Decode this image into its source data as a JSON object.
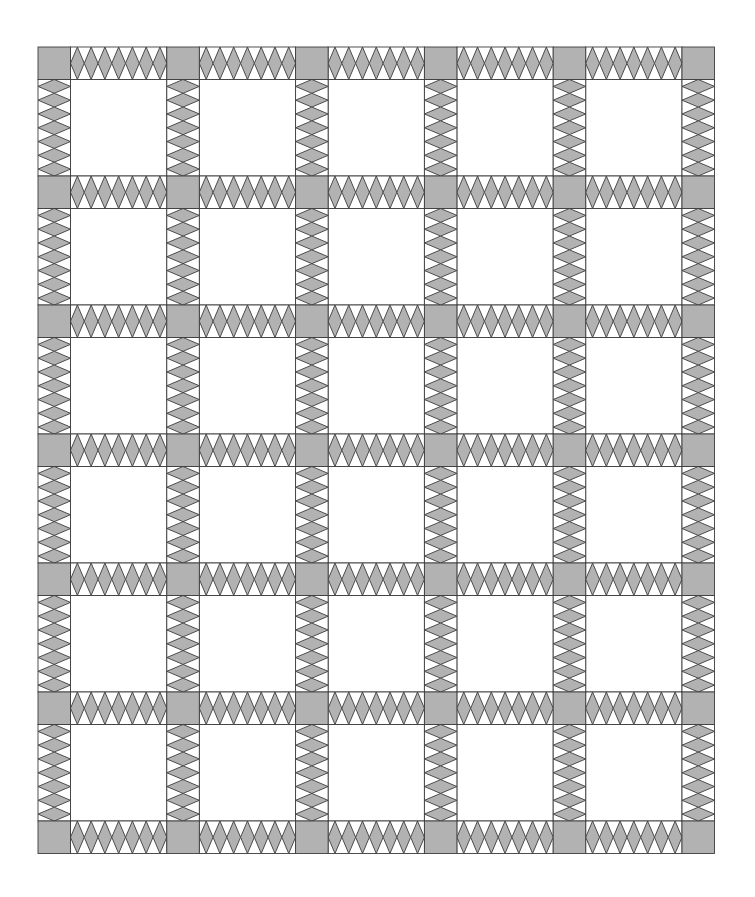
{
  "quilt": {
    "pattern": "sashing-with-diamond-strips-and-corner-posts",
    "columns": 5,
    "rows": 6,
    "origin": {
      "x": 38,
      "y": 47
    },
    "post_size": 32.5,
    "block_size_x": 96.3,
    "block_size_y": 96.5,
    "diamonds_per_strip": 7,
    "colors": {
      "background": "#ffffff",
      "post_fill": "#b2b2b2",
      "diamond_fill": "#b2b2b2",
      "block_fill": "#ffffff",
      "stroke": "#3c3c3c"
    },
    "stroke_width": 0.9
  }
}
